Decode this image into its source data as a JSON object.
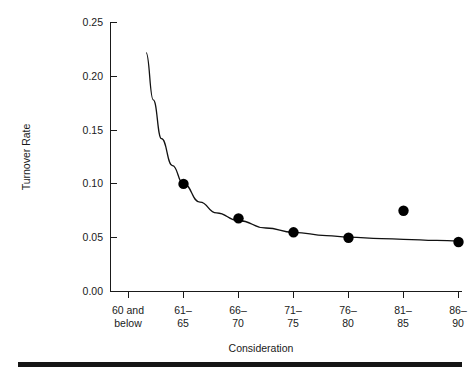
{
  "chart_data": {
    "type": "scatter",
    "title": "",
    "subtitle": "",
    "xlabel": "Consideration",
    "ylabel": "Turnover Rate",
    "categories": [
      "60 and below",
      "61–65",
      "66–70",
      "71–75",
      "76–80",
      "81–85",
      "86–90"
    ],
    "category_lines": [
      [
        "60 and",
        "below"
      ],
      [
        "61–",
        "65"
      ],
      [
        "66–",
        "70"
      ],
      [
        "71–",
        "75"
      ],
      [
        "76–",
        "80"
      ],
      [
        "81–",
        "85"
      ],
      [
        "86–",
        "90"
      ]
    ],
    "series": [
      {
        "name": "Observed turnover rate",
        "type": "scatter",
        "marker": "filled-circle",
        "color": "#000000",
        "values": [
          null,
          0.1,
          0.068,
          0.055,
          0.05,
          0.075,
          0.046
        ]
      },
      {
        "name": "Fitted curve",
        "type": "line",
        "color": "#111111",
        "points": [
          [
            0.32,
            0.222
          ],
          [
            0.45,
            0.178
          ],
          [
            0.6,
            0.142
          ],
          [
            0.8,
            0.117
          ],
          [
            1.0,
            0.1
          ],
          [
            1.3,
            0.083
          ],
          [
            1.6,
            0.073
          ],
          [
            2.0,
            0.066
          ],
          [
            2.5,
            0.059
          ],
          [
            3.0,
            0.055
          ],
          [
            3.6,
            0.052
          ],
          [
            4.0,
            0.0505
          ],
          [
            4.6,
            0.0492
          ],
          [
            5.0,
            0.0485
          ],
          [
            5.6,
            0.0475
          ],
          [
            6.0,
            0.047
          ]
        ]
      }
    ],
    "ylim": [
      0.0,
      0.25
    ],
    "yticks": [
      "0.00",
      "0.05",
      "0.10",
      "0.15",
      "0.20",
      "0.25"
    ],
    "ytick_values": [
      0.0,
      0.05,
      0.1,
      0.15,
      0.2,
      0.25
    ],
    "xlim": [
      0,
      6
    ],
    "grid": false,
    "legend": "none"
  },
  "figure": {
    "axis_color": "#1a1a1a",
    "point_color": "#000000",
    "curve_color": "#111111",
    "background": "#ffffff",
    "rule_color": "#151515"
  }
}
